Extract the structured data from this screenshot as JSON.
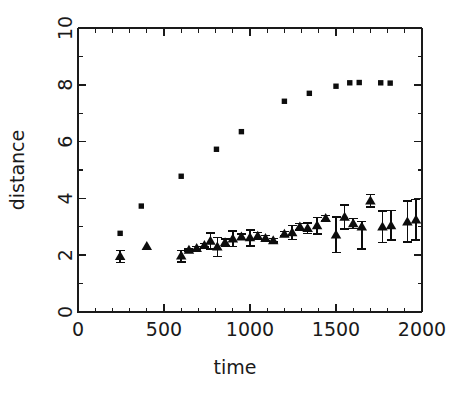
{
  "chart_data": {
    "type": "scatter",
    "title": "",
    "xlabel": "time",
    "ylabel": "distance",
    "xlim": [
      0,
      2000
    ],
    "ylim": [
      0,
      10
    ],
    "grid": false,
    "legend": "none",
    "xticks": [
      0,
      500,
      1000,
      1500,
      2000
    ],
    "xticklabels": [
      "0",
      "500",
      "1000",
      "1500",
      "2000"
    ],
    "x_minor_interval": 100,
    "yticks": [
      0,
      2,
      4,
      6,
      8,
      10
    ],
    "yticklabels": [
      "0",
      "2",
      "4",
      "6",
      "8",
      "10"
    ],
    "y_minor_interval": 1,
    "series": [
      {
        "name": "squares",
        "marker": "square",
        "color": "#0d0d0d",
        "has_errorbars": false,
        "points": [
          {
            "x": 245,
            "y": 2.77
          },
          {
            "x": 368,
            "y": 3.73
          },
          {
            "x": 600,
            "y": 4.78
          },
          {
            "x": 805,
            "y": 5.73
          },
          {
            "x": 950,
            "y": 6.35
          },
          {
            "x": 1200,
            "y": 7.42
          },
          {
            "x": 1345,
            "y": 7.7
          },
          {
            "x": 1500,
            "y": 7.95
          },
          {
            "x": 1580,
            "y": 8.07
          },
          {
            "x": 1635,
            "y": 8.08
          },
          {
            "x": 1760,
            "y": 8.07
          },
          {
            "x": 1815,
            "y": 8.06
          }
        ]
      },
      {
        "name": "triangles",
        "marker": "triangle",
        "color": "#0d0d0d",
        "has_errorbars": true,
        "points": [
          {
            "x": 245,
            "y": 1.96,
            "yerr_low": 0.22,
            "yerr_high": 0.2
          },
          {
            "x": 400,
            "y": 2.32,
            "yerr_low": 0.02,
            "yerr_high": 0.02
          },
          {
            "x": 600,
            "y": 1.98,
            "yerr_low": 0.22,
            "yerr_high": 0.18
          },
          {
            "x": 645,
            "y": 2.18,
            "yerr_low": 0.04,
            "yerr_high": 0.04
          },
          {
            "x": 690,
            "y": 2.25,
            "yerr_low": 0.05,
            "yerr_high": 0.05
          },
          {
            "x": 735,
            "y": 2.35,
            "yerr_low": 0.06,
            "yerr_high": 0.06
          },
          {
            "x": 770,
            "y": 2.5,
            "yerr_low": 0.28,
            "yerr_high": 0.28
          },
          {
            "x": 810,
            "y": 2.3,
            "yerr_low": 0.35,
            "yerr_high": 0.32
          },
          {
            "x": 855,
            "y": 2.45,
            "yerr_low": 0.12,
            "yerr_high": 0.12
          },
          {
            "x": 900,
            "y": 2.58,
            "yerr_low": 0.27,
            "yerr_high": 0.27
          },
          {
            "x": 950,
            "y": 2.65,
            "yerr_low": 0.1,
            "yerr_high": 0.1
          },
          {
            "x": 1000,
            "y": 2.62,
            "yerr_low": 0.3,
            "yerr_high": 0.26
          },
          {
            "x": 1045,
            "y": 2.68,
            "yerr_low": 0.12,
            "yerr_high": 0.12
          },
          {
            "x": 1090,
            "y": 2.6,
            "yerr_low": 0.1,
            "yerr_high": 0.1
          },
          {
            "x": 1135,
            "y": 2.52,
            "yerr_low": 0.06,
            "yerr_high": 0.06
          },
          {
            "x": 1200,
            "y": 2.75,
            "yerr_low": 0.08,
            "yerr_high": 0.08
          },
          {
            "x": 1245,
            "y": 2.8,
            "yerr_low": 0.25,
            "yerr_high": 0.25
          },
          {
            "x": 1290,
            "y": 3.0,
            "yerr_low": 0.12,
            "yerr_high": 0.12
          },
          {
            "x": 1335,
            "y": 2.95,
            "yerr_low": 0.18,
            "yerr_high": 0.18
          },
          {
            "x": 1390,
            "y": 3.05,
            "yerr_low": 0.3,
            "yerr_high": 0.28
          },
          {
            "x": 1440,
            "y": 3.3,
            "yerr_low": 0.1,
            "yerr_high": 0.1
          },
          {
            "x": 1500,
            "y": 2.72,
            "yerr_low": 0.62,
            "yerr_high": 0.62
          },
          {
            "x": 1550,
            "y": 3.35,
            "yerr_low": 0.42,
            "yerr_high": 0.42
          },
          {
            "x": 1600,
            "y": 3.12,
            "yerr_low": 0.18,
            "yerr_high": 0.18
          },
          {
            "x": 1650,
            "y": 3.0,
            "yerr_low": 0.78,
            "yerr_high": 0.18
          },
          {
            "x": 1700,
            "y": 3.92,
            "yerr_low": 0.22,
            "yerr_high": 0.22
          },
          {
            "x": 1770,
            "y": 3.0,
            "yerr_low": 0.55,
            "yerr_high": 0.55
          },
          {
            "x": 1820,
            "y": 3.05,
            "yerr_low": 0.52,
            "yerr_high": 0.52
          },
          {
            "x": 1915,
            "y": 3.18,
            "yerr_low": 0.72,
            "yerr_high": 0.72
          },
          {
            "x": 1965,
            "y": 3.25,
            "yerr_low": 0.72,
            "yerr_high": 0.72
          }
        ]
      }
    ]
  }
}
